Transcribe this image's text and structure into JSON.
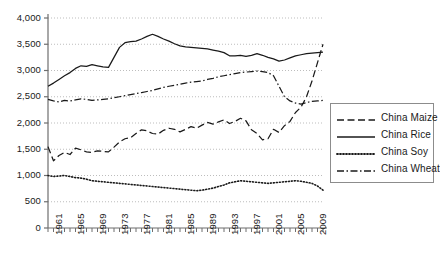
{
  "chart_data": {
    "type": "line",
    "title": "",
    "subtitle": "",
    "xlabel": "",
    "ylabel": "",
    "xlim": [
      1961,
      2011
    ],
    "ylim": [
      0,
      4000
    ],
    "grid": true,
    "legend_position": "right",
    "ytick_labels": [
      "4,000",
      "3,500",
      "3,000",
      "2,500",
      "2,000",
      "1,500",
      "1,000",
      "500",
      "0"
    ],
    "ytick_values": [
      4000,
      3500,
      3000,
      2500,
      2000,
      1500,
      1000,
      500,
      0
    ],
    "xtick_labels": [
      "1961",
      "1965",
      "1969",
      "1973",
      "1977",
      "1981",
      "1985",
      "1989",
      "1993",
      "1997",
      "2001",
      "2005",
      "2009"
    ],
    "xtick_values": [
      1961,
      1965,
      1969,
      1973,
      1977,
      1981,
      1985,
      1989,
      1993,
      1997,
      2001,
      2005,
      2009
    ],
    "x": [
      1961,
      1962,
      1963,
      1964,
      1965,
      1966,
      1967,
      1968,
      1969,
      1970,
      1971,
      1972,
      1973,
      1974,
      1975,
      1976,
      1977,
      1978,
      1979,
      1980,
      1981,
      1982,
      1983,
      1984,
      1985,
      1986,
      1987,
      1988,
      1989,
      1990,
      1991,
      1992,
      1993,
      1994,
      1995,
      1996,
      1997,
      1998,
      1999,
      2000,
      2001,
      2002,
      2003,
      2004,
      2005,
      2006,
      2007,
      2008,
      2009,
      2010,
      2011
    ],
    "series": [
      {
        "name": "China Maize",
        "style": "dashed",
        "color": "#1a1a1a",
        "values": [
          1550,
          1280,
          1380,
          1440,
          1400,
          1520,
          1490,
          1450,
          1440,
          1470,
          1460,
          1450,
          1540,
          1640,
          1700,
          1720,
          1800,
          1870,
          1850,
          1800,
          1790,
          1860,
          1900,
          1880,
          1830,
          1880,
          1930,
          1900,
          1960,
          2010,
          1980,
          2020,
          2060,
          1990,
          2030,
          2090,
          2040,
          1870,
          1800,
          1680,
          1700,
          1880,
          1820,
          1950,
          2030,
          2200,
          2300,
          2500,
          2800,
          3150,
          3500
        ]
      },
      {
        "name": "China Rice",
        "style": "solid",
        "color": "#1a1a1a",
        "values": [
          2700,
          2760,
          2830,
          2900,
          2960,
          3040,
          3090,
          3080,
          3110,
          3090,
          3070,
          3060,
          3250,
          3440,
          3530,
          3550,
          3560,
          3600,
          3650,
          3690,
          3650,
          3600,
          3560,
          3510,
          3470,
          3450,
          3440,
          3430,
          3420,
          3410,
          3390,
          3370,
          3340,
          3280,
          3280,
          3290,
          3270,
          3290,
          3320,
          3290,
          3250,
          3220,
          3180,
          3200,
          3240,
          3280,
          3300,
          3320,
          3330,
          3340,
          3350
        ]
      },
      {
        "name": "China Soy",
        "style": "dotted",
        "color": "#1a1a1a",
        "values": [
          1000,
          980,
          990,
          1000,
          980,
          960,
          950,
          930,
          900,
          890,
          880,
          870,
          860,
          850,
          840,
          830,
          820,
          810,
          800,
          790,
          780,
          770,
          760,
          750,
          740,
          730,
          720,
          710,
          720,
          740,
          760,
          790,
          820,
          860,
          880,
          900,
          890,
          880,
          870,
          860,
          850,
          860,
          870,
          880,
          890,
          900,
          890,
          870,
          850,
          800,
          720
        ]
      },
      {
        "name": "China Wheat",
        "style": "dashdot",
        "color": "#1a1a1a",
        "values": [
          2450,
          2420,
          2400,
          2430,
          2420,
          2440,
          2460,
          2450,
          2430,
          2440,
          2450,
          2460,
          2480,
          2500,
          2520,
          2540,
          2560,
          2580,
          2600,
          2620,
          2650,
          2680,
          2700,
          2720,
          2740,
          2760,
          2780,
          2790,
          2800,
          2830,
          2850,
          2880,
          2900,
          2920,
          2940,
          2960,
          2970,
          2980,
          2990,
          2980,
          2960,
          2900,
          2700,
          2500,
          2420,
          2380,
          2360,
          2390,
          2410,
          2420,
          2430
        ]
      }
    ]
  },
  "legend": {
    "items": [
      {
        "label": "China Maize",
        "style": "dashed"
      },
      {
        "label": "China Rice",
        "style": "solid"
      },
      {
        "label": "China Soy",
        "style": "dotted"
      },
      {
        "label": "China Wheat",
        "style": "dashdot"
      }
    ]
  }
}
